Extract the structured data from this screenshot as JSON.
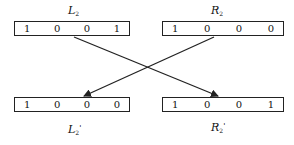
{
  "registers": {
    "top_left": {
      "name": "L",
      "sub": "2",
      "prime": "",
      "bits": [
        "1",
        "0",
        "0",
        "1"
      ]
    },
    "top_right": {
      "name": "R",
      "sub": "2",
      "prime": "",
      "bits": [
        "1",
        "0",
        "0",
        "0"
      ]
    },
    "bottom_left": {
      "name": "L",
      "sub": "2",
      "prime": "'",
      "bits": [
        "1",
        "0",
        "0",
        "0"
      ]
    },
    "bottom_right": {
      "name": "R",
      "sub": "2",
      "prime": "'",
      "bits": [
        "1",
        "0",
        "0",
        "1"
      ]
    }
  },
  "arrows": [
    {
      "from": "top_left",
      "to": "bottom_right"
    },
    {
      "from": "top_right",
      "to": "bottom_left"
    }
  ],
  "colors": {
    "line": "#222222",
    "background": "#ffffff"
  }
}
